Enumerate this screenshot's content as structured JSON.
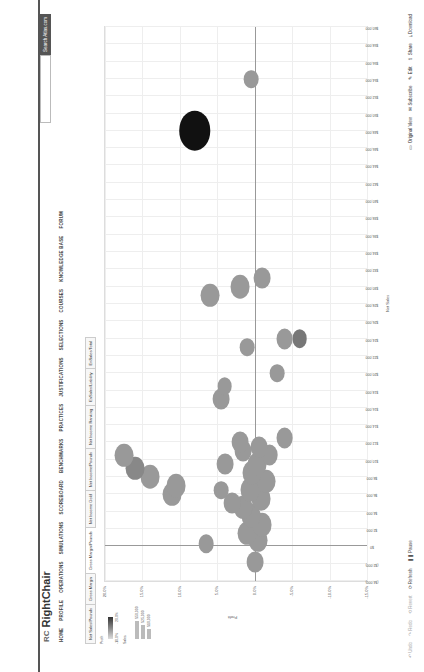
{
  "header": {
    "logo_mark": "RC",
    "logo_text": "RightChair",
    "search_placeholder": "",
    "search_button": "Search Atlas.com"
  },
  "nav": [
    "HOME",
    "PROFILE",
    "OPERATIONS",
    "SIMULATIONS",
    "SCOREBOARD",
    "BENCHMARKS",
    "PRACTICES",
    "JUSTIFICATIONS",
    "SELECTIONS",
    "COURSES",
    "KNOWLEDGE BASE",
    "FORUM"
  ],
  "tabs": [
    {
      "label": "Net Sales/Pounds",
      "active": false
    },
    {
      "label": "Gross Margin",
      "active": false
    },
    {
      "label": "Gross Margin/Pounds",
      "active": true
    },
    {
      "label": "Net Income Gold",
      "active": false
    },
    {
      "label": "Net Income/Pounds",
      "active": false
    },
    {
      "label": "Net Income Ranking",
      "active": false
    },
    {
      "label": "EnSales/Liability",
      "active": false
    },
    {
      "label": "EnSales/Total",
      "active": false
    }
  ],
  "legend": {
    "color_title": "Profit",
    "color_min": "-10.0%",
    "color_max": "20.0%",
    "size_title": "Sales",
    "size_values": [
      "$50,000",
      "$25,000",
      "$10,000"
    ]
  },
  "toolbar": {
    "left": [
      {
        "label": "Undo",
        "enabled": false
      },
      {
        "label": "Redo",
        "enabled": false
      },
      {
        "label": "Revert",
        "enabled": false
      },
      {
        "label": "Refresh",
        "enabled": true
      },
      {
        "label": "Pause",
        "enabled": true
      }
    ],
    "right": [
      "Original View",
      "Subscribe",
      "Edit",
      "Share",
      "Download"
    ]
  },
  "chart_data": {
    "type": "scatter",
    "title": "",
    "xlabel": "Net Sales",
    "ylabel": "Profit",
    "xlim": [
      -4000,
      60000
    ],
    "ylim": [
      -15,
      20
    ],
    "x_ticks": [
      "($4,000)",
      "($2,000)",
      "$0",
      "$2,000",
      "$4,000",
      "$6,000",
      "$8,000",
      "$10,000",
      "$12,000",
      "$14,000",
      "$16,000",
      "$18,000",
      "$20,000",
      "$22,000",
      "$24,000",
      "$26,000",
      "$28,000",
      "$30,000",
      "$32,000",
      "$34,000",
      "$36,000",
      "$38,000",
      "$40,000",
      "$42,000",
      "$44,000",
      "$46,000",
      "$48,000",
      "$50,000",
      "$52,000",
      "$54,000",
      "$56,000",
      "$58,000",
      "$60,000"
    ],
    "y_ticks": [
      "20.0%",
      "15.0%",
      "10.0%",
      "5.0%",
      "0.0%",
      "-5.0%",
      "-10.0%",
      "-15.0%"
    ],
    "grid": true,
    "points": [
      {
        "x": -1800,
        "y": 0.0,
        "size": 8,
        "shade": "#999"
      },
      {
        "x": 300,
        "y": 6.5,
        "size": 7,
        "shade": "#999"
      },
      {
        "x": 700,
        "y": -0.5,
        "size": 9,
        "shade": "#999"
      },
      {
        "x": 1500,
        "y": 1.0,
        "size": 9,
        "shade": "#999"
      },
      {
        "x": 2500,
        "y": -1.0,
        "size": 9,
        "shade": "#999"
      },
      {
        "x": 3500,
        "y": 0.5,
        "size": 9,
        "shade": "#999"
      },
      {
        "x": 4500,
        "y": 1.5,
        "size": 9,
        "shade": "#999"
      },
      {
        "x": 5500,
        "y": -0.8,
        "size": 9,
        "shade": "#999"
      },
      {
        "x": 6500,
        "y": 0.6,
        "size": 9,
        "shade": "#999"
      },
      {
        "x": 7500,
        "y": -1.5,
        "size": 9,
        "shade": "#999"
      },
      {
        "x": 8500,
        "y": 0.3,
        "size": 9,
        "shade": "#999"
      },
      {
        "x": 9500,
        "y": -0.3,
        "size": 9,
        "shade": "#999"
      },
      {
        "x": 10500,
        "y": -2.0,
        "size": 8,
        "shade": "#999"
      },
      {
        "x": 11500,
        "y": -0.6,
        "size": 8,
        "shade": "#999"
      },
      {
        "x": 12500,
        "y": -4.0,
        "size": 8,
        "shade": "#999"
      },
      {
        "x": 5000,
        "y": 3.0,
        "size": 8,
        "shade": "#999"
      },
      {
        "x": 6500,
        "y": 4.5,
        "size": 7,
        "shade": "#999"
      },
      {
        "x": 6000,
        "y": 11.0,
        "size": 9,
        "shade": "#999"
      },
      {
        "x": 7000,
        "y": 10.5,
        "size": 9,
        "shade": "#999"
      },
      {
        "x": 8000,
        "y": 14.0,
        "size": 9,
        "shade": "#999"
      },
      {
        "x": 9500,
        "y": 4.0,
        "size": 8,
        "shade": "#999"
      },
      {
        "x": 9000,
        "y": 16.0,
        "size": 9,
        "shade": "#888"
      },
      {
        "x": 10500,
        "y": 17.5,
        "size": 9,
        "shade": "#999"
      },
      {
        "x": 11000,
        "y": 1.5,
        "size": 8,
        "shade": "#999"
      },
      {
        "x": 12000,
        "y": 2.0,
        "size": 8,
        "shade": "#999"
      },
      {
        "x": 17000,
        "y": 4.5,
        "size": 8,
        "shade": "#999"
      },
      {
        "x": 18500,
        "y": 4.0,
        "size": 7,
        "shade": "#999"
      },
      {
        "x": 20000,
        "y": -3.0,
        "size": 7,
        "shade": "#999"
      },
      {
        "x": 24000,
        "y": -6.0,
        "size": 7,
        "shade": "#777"
      },
      {
        "x": 23000,
        "y": 1.0,
        "size": 7,
        "shade": "#999"
      },
      {
        "x": 24000,
        "y": -4.0,
        "size": 8,
        "shade": "#999"
      },
      {
        "x": 29000,
        "y": 6.0,
        "size": 9,
        "shade": "#999"
      },
      {
        "x": 30000,
        "y": 2.0,
        "size": 9,
        "shade": "#999"
      },
      {
        "x": 31000,
        "y": -1.0,
        "size": 8,
        "shade": "#999"
      },
      {
        "x": 48000,
        "y": 8.0,
        "size": 15,
        "shade": "#111"
      },
      {
        "x": 54000,
        "y": 0.5,
        "size": 7,
        "shade": "#999"
      }
    ]
  }
}
